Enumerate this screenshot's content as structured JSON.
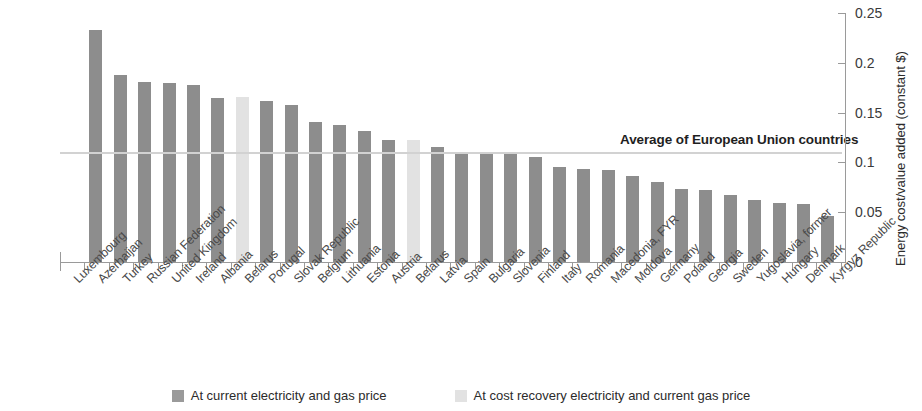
{
  "chart_data": {
    "type": "bar",
    "title": "",
    "xlabel": "",
    "ylabel": "Energy cost/value added (constant $)",
    "ylim": [
      0,
      0.25
    ],
    "yticks": [
      "0",
      "0.05",
      "0.1",
      "0.15",
      "0.2",
      "0.25"
    ],
    "ytick_values": [
      0,
      0.05,
      0.1,
      0.15,
      0.2,
      0.25
    ],
    "grid": false,
    "legend_position": "bottom",
    "categories": [
      "Luxembourg",
      "Azerbaijan",
      "Turkey",
      "Russian Federation",
      "United Kingdom",
      "Ireland",
      "Albania",
      "Belarus",
      "Portugal",
      "Slovak Republic",
      "Belgium",
      "Lithuania",
      "Estonia",
      "Austria",
      "Belarus",
      "Latvia",
      "Spain",
      "Bulgaria",
      "Slovenia",
      "Finland",
      "Italy",
      "Romania",
      "Macedonia, FYR",
      "Moldova",
      "Germany",
      "Poland",
      "Georgia",
      "Sweden",
      "Yugoslavia, former",
      "Hungary",
      "Denmark",
      "Kyrgyz Republic"
    ],
    "series": [
      {
        "name": "At current electricity and gas price",
        "color": "#8d8d8d",
        "values": [
          null,
          0.233,
          0.188,
          0.181,
          0.18,
          0.178,
          0.165,
          null,
          0.162,
          0.158,
          0.141,
          0.138,
          0.132,
          0.122,
          null,
          0.115,
          0.11,
          0.109,
          0.108,
          0.105,
          0.095,
          0.093,
          0.092,
          0.086,
          0.08,
          0.073,
          0.072,
          0.067,
          0.062,
          0.059,
          0.058,
          0.046
        ]
      },
      {
        "name": "At cost recovery electricity and current gas price",
        "color": "#e2e2e2",
        "values": [
          null,
          null,
          null,
          null,
          null,
          null,
          null,
          0.166,
          null,
          null,
          null,
          null,
          null,
          null,
          0.122,
          null,
          null,
          null,
          null,
          null,
          null,
          null,
          null,
          null,
          null,
          null,
          null,
          null,
          null,
          null,
          null,
          null
        ]
      }
    ],
    "annotations": [
      {
        "label": "Average of European Union countries",
        "value": 0.11,
        "type": "hline",
        "color": "#d2d2d2"
      }
    ]
  },
  "legend": {
    "entries": [
      {
        "label": "At current electricity and gas price",
        "swatch": "dark"
      },
      {
        "label": "At cost recovery electricity and current gas price",
        "swatch": "light"
      }
    ]
  }
}
